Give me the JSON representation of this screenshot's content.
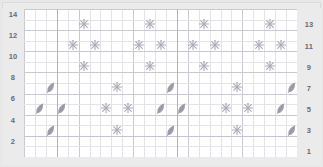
{
  "chart_title": "",
  "axes": {
    "left_label_name": "row-numbers-left",
    "right_label_name": "row-numbers-right",
    "left_rows": [
      14,
      12,
      10,
      8,
      6,
      4,
      2
    ],
    "right_rows": [
      13,
      11,
      9,
      7,
      5,
      3,
      1
    ]
  },
  "grid": {
    "columns": 25,
    "rows": 14,
    "cell_width": 10.92,
    "cell_height": 10.57,
    "gridline_color": "#e4e4e8",
    "major_gridline_color": "#c9c9d2",
    "repeat_line_color": "#b2b2bd",
    "background": "#ffffff",
    "frame_color": "#ebebeb",
    "major_column_step": 5,
    "major_row_step": 2
  },
  "legend_colors": {
    "symbol_gray": "#a9a9b6",
    "leaf_gray": "#8f8f9e",
    "text_gray": "#6a6a72"
  },
  "repeat_lines": [
    3,
    14
  ],
  "chart_data": {
    "type": "scatter",
    "title": "",
    "xlabel": "",
    "ylabel": "",
    "xlim": [
      0,
      25
    ],
    "ylim": [
      1,
      14
    ],
    "grid": true,
    "legend": "none",
    "symbols": {
      "star": "yarn-over-star",
      "leaf": "decrease-leaf"
    },
    "points": [
      {
        "col": 6,
        "row": 13,
        "symbol": "star"
      },
      {
        "col": 12,
        "row": 13,
        "symbol": "star"
      },
      {
        "col": 17,
        "row": 13,
        "symbol": "star"
      },
      {
        "col": 23,
        "row": 13,
        "symbol": "star"
      },
      {
        "col": 5,
        "row": 11,
        "symbol": "star"
      },
      {
        "col": 7,
        "row": 11,
        "symbol": "star"
      },
      {
        "col": 11,
        "row": 11,
        "symbol": "star"
      },
      {
        "col": 13,
        "row": 11,
        "symbol": "star"
      },
      {
        "col": 16,
        "row": 11,
        "symbol": "star"
      },
      {
        "col": 18,
        "row": 11,
        "symbol": "star"
      },
      {
        "col": 22,
        "row": 11,
        "symbol": "star"
      },
      {
        "col": 24,
        "row": 11,
        "symbol": "star"
      },
      {
        "col": 6,
        "row": 9,
        "symbol": "star"
      },
      {
        "col": 12,
        "row": 9,
        "symbol": "star"
      },
      {
        "col": 17,
        "row": 9,
        "symbol": "star"
      },
      {
        "col": 23,
        "row": 9,
        "symbol": "star"
      },
      {
        "col": 3,
        "row": 7,
        "symbol": "leaf"
      },
      {
        "col": 9,
        "row": 7,
        "symbol": "star"
      },
      {
        "col": 14,
        "row": 7,
        "symbol": "leaf"
      },
      {
        "col": 20,
        "row": 7,
        "symbol": "star"
      },
      {
        "col": 25,
        "row": 7,
        "symbol": "leaf"
      },
      {
        "col": 2,
        "row": 5,
        "symbol": "leaf"
      },
      {
        "col": 4,
        "row": 5,
        "symbol": "leaf"
      },
      {
        "col": 8,
        "row": 5,
        "symbol": "star"
      },
      {
        "col": 10,
        "row": 5,
        "symbol": "star"
      },
      {
        "col": 13,
        "row": 5,
        "symbol": "leaf"
      },
      {
        "col": 15,
        "row": 5,
        "symbol": "leaf"
      },
      {
        "col": 19,
        "row": 5,
        "symbol": "star"
      },
      {
        "col": 21,
        "row": 5,
        "symbol": "star"
      },
      {
        "col": 24,
        "row": 5,
        "symbol": "leaf"
      },
      {
        "col": 26,
        "row": 5,
        "symbol": "leaf"
      },
      {
        "col": 3,
        "row": 3,
        "symbol": "leaf"
      },
      {
        "col": 9,
        "row": 3,
        "symbol": "star"
      },
      {
        "col": 14,
        "row": 3,
        "symbol": "leaf"
      },
      {
        "col": 20,
        "row": 3,
        "symbol": "star"
      },
      {
        "col": 25,
        "row": 3,
        "symbol": "leaf"
      }
    ]
  }
}
